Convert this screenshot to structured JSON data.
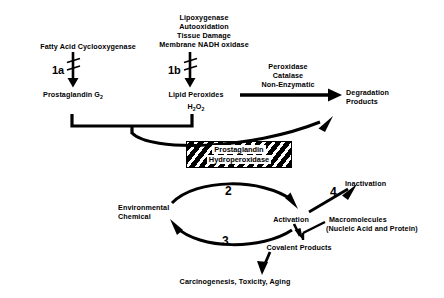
{
  "figure": {
    "type": "biochemical-pathway-diagram",
    "background_color": "#ffffff",
    "ink_color": "#000000"
  },
  "nodes": {
    "cyclooxygenase_label": "Fatty Acid Cyclooxygenase",
    "lipoxygenase_block": {
      "line1": "Lipoxygenase",
      "line2": "Autooxidation",
      "line3": "Tissue Damage",
      "line4": "Membrane NADH oxidase"
    },
    "prostaglandin_g2": "Prostaglandin G",
    "prostaglandin_g2_sub": "2",
    "lipid_peroxides": "Lipid Peroxides",
    "hydrogen_peroxide": "H",
    "hydrogen_peroxide_sub1": "2",
    "hydrogen_peroxide_mid": "O",
    "hydrogen_peroxide_sub2": "2",
    "peroxidase_block": {
      "line1": "Peroxidase",
      "line2": "Catalase",
      "line3": "Non-Enzymatic"
    },
    "degradation_products": {
      "line1": "Degradation",
      "line2": "Products"
    },
    "enzyme_box": {
      "line1": "Prostaglandin",
      "line2": "Hydroperoxidase"
    },
    "environmental_chemical": {
      "line1": "Environmental",
      "line2": "Chemical"
    },
    "activation": "Activation",
    "inactivation": "Inactivation",
    "macromolecules": {
      "line1": "Macromolecules",
      "line2": "(Nucleic Acid and Protein)"
    },
    "covalent_products": "Covalent Products",
    "outcome": "Carcinogenesis, Toxicity, Aging"
  },
  "step_numbers": {
    "step_1a": "1a",
    "step_1b": "1b",
    "step_2": "2",
    "step_3": "3",
    "step_4": "4"
  }
}
